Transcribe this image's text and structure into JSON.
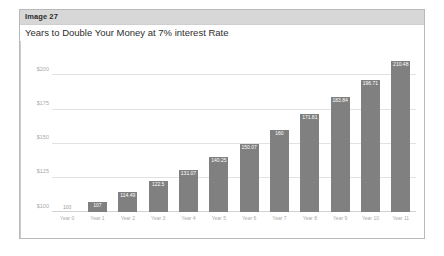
{
  "card": {
    "header_label": "Image 27"
  },
  "chart_data": {
    "type": "bar",
    "title": "Years to Double Your Money at 7% interest Rate",
    "xlabel": "",
    "ylabel": "",
    "categories": [
      "Year 0",
      "Year 1",
      "Year 2",
      "Year 3",
      "Year 4",
      "Year 5",
      "Year 6",
      "Year 7",
      "Year 8",
      "Year 9",
      "Year 10",
      "Year 11"
    ],
    "values": [
      100,
      107,
      114.49,
      122.5,
      131.07,
      140.25,
      150.07,
      160,
      171.81,
      183.84,
      196.71,
      210.48
    ],
    "value_labels": [
      "100",
      "107",
      "114.49",
      "122.5",
      "131.07",
      "140.25",
      "150.07",
      "160",
      "171.81",
      "183.84",
      "196.71",
      "210.48"
    ],
    "ylim": [
      100,
      215
    ],
    "yticks": [
      100,
      125,
      150,
      175,
      200
    ],
    "ytick_labels": [
      "$100",
      "$125",
      "$150",
      "$175",
      "$200"
    ],
    "grid": true,
    "legend": "none",
    "bar_color": "#808080",
    "grid_color": "#e2e2e2",
    "axis_text_color": "#a8a8a8"
  }
}
